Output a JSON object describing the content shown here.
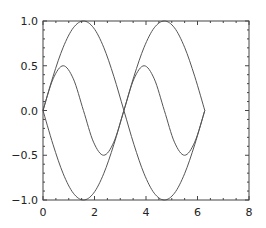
{
  "chart_data": {
    "type": "line",
    "title": "",
    "xlabel": "",
    "ylabel": "",
    "xlim": [
      0,
      8
    ],
    "ylim": [
      -1.0,
      1.0
    ],
    "grid": false,
    "legend": null,
    "x_ticks": [
      "0",
      "2",
      "4",
      "6",
      "8"
    ],
    "y_ticks": [
      "1.0",
      "0.5",
      "0.0",
      "−0.5",
      "−1.0"
    ],
    "x_tick_values": [
      0,
      2,
      4,
      6,
      8
    ],
    "y_tick_values": [
      1.0,
      0.5,
      0.0,
      -0.5,
      -1.0
    ],
    "series": [
      {
        "name": "sin(x)",
        "color": "#555555",
        "x": [
          0,
          0.3927,
          0.7854,
          1.1781,
          1.5708,
          1.9635,
          2.3562,
          2.7489,
          3.1416,
          3.5343,
          3.927,
          4.3197,
          4.7124,
          5.1051,
          5.4978,
          5.8905,
          6.2832
        ],
        "values": [
          0.0,
          0.383,
          0.707,
          0.924,
          1.0,
          0.924,
          0.707,
          0.383,
          0.0,
          -0.383,
          -0.707,
          -0.924,
          -1.0,
          -0.924,
          -0.707,
          -0.383,
          0.0
        ],
        "note": "curve A: rises 0→1 at π/2, 0 at π, −1 at 3π/2, 0 at 2π"
      },
      {
        "name": "-sin(x)",
        "color": "#555555",
        "x": [
          0,
          0.3927,
          0.7854,
          1.1781,
          1.5708,
          1.9635,
          2.3562,
          2.7489,
          3.1416,
          3.5343,
          3.927,
          4.3197,
          4.7124,
          5.1051,
          5.4978,
          5.8905,
          6.2832
        ],
        "values": [
          0.0,
          -0.383,
          -0.707,
          -0.924,
          -1.0,
          -0.924,
          -0.707,
          -0.383,
          0.0,
          0.383,
          0.707,
          0.924,
          1.0,
          0.924,
          0.707,
          0.383,
          0.0
        ]
      },
      {
        "name": "0.5*sin(2x)",
        "color": "#555555",
        "x": [
          0,
          0.3927,
          0.7854,
          1.1781,
          1.5708,
          1.9635,
          2.3562,
          2.7489,
          3.1416,
          3.5343,
          3.927,
          4.3197,
          4.7124,
          5.1051,
          5.4978,
          5.8905,
          6.2832
        ],
        "values": [
          0.0,
          0.354,
          0.5,
          0.354,
          0.0,
          -0.354,
          -0.5,
          -0.354,
          0.0,
          0.354,
          0.5,
          0.354,
          0.0,
          -0.354,
          -0.5,
          -0.354,
          0.0
        ]
      }
    ]
  },
  "plot": {
    "frame_color": "#444444",
    "line_width": 1
  }
}
